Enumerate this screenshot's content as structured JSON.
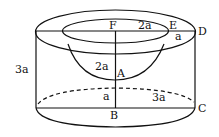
{
  "labels": {
    "F": "F",
    "E": "E",
    "D": "D",
    "A": "A",
    "B": "B",
    "C": "C",
    "fe": "2a",
    "ed": "a",
    "fa": "2a",
    "ab": "a",
    "bc": "3a",
    "height": "3a"
  },
  "colors": {
    "stroke": "#111111",
    "background": "#ffffff"
  }
}
